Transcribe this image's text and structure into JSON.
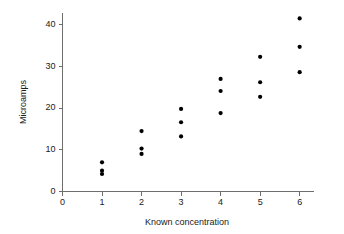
{
  "chart_data": {
    "type": "scatter",
    "title": "",
    "xlabel": "Known concentration",
    "ylabel": "Microamps",
    "xlim": [
      0,
      6.35
    ],
    "ylim": [
      0,
      42.8
    ],
    "xticks": [
      0,
      1,
      2,
      3,
      4,
      5,
      6
    ],
    "xtick_labels": [
      "0",
      "1",
      "2",
      "3",
      "4",
      "5",
      "6"
    ],
    "yticks": [
      0,
      10,
      20,
      30,
      40
    ],
    "ytick_labels": [
      "0",
      "10",
      "20",
      "30",
      "40"
    ],
    "grid": false,
    "legend": null,
    "marker": "filled-circle",
    "marker_color": "#000000",
    "marker_size_px": 4.2,
    "axis_color": "#6e6e6e",
    "background_color": "#ffffff",
    "series": [
      {
        "name": "measurements",
        "points": [
          {
            "x": 1,
            "y": 7.0
          },
          {
            "x": 1,
            "y": 5.0
          },
          {
            "x": 1,
            "y": 4.2
          },
          {
            "x": 2,
            "y": 14.5
          },
          {
            "x": 2,
            "y": 10.3
          },
          {
            "x": 2,
            "y": 9.0
          },
          {
            "x": 3,
            "y": 19.8
          },
          {
            "x": 3,
            "y": 16.6
          },
          {
            "x": 3,
            "y": 13.2
          },
          {
            "x": 4,
            "y": 27.0
          },
          {
            "x": 4,
            "y": 24.1
          },
          {
            "x": 4,
            "y": 18.8
          },
          {
            "x": 5,
            "y": 32.3
          },
          {
            "x": 5,
            "y": 26.2
          },
          {
            "x": 5,
            "y": 22.7
          },
          {
            "x": 6,
            "y": 41.5
          },
          {
            "x": 6,
            "y": 34.7
          },
          {
            "x": 6,
            "y": 28.6
          }
        ]
      }
    ]
  }
}
